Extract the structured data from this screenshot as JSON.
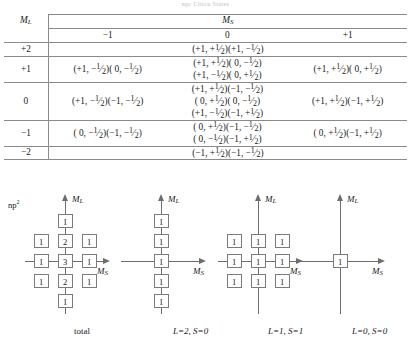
{
  "caption_top": "npc  Citicu  States",
  "table": {
    "corner_label": "M_L",
    "ms_header": "M_S",
    "ms_columns": [
      "-1",
      "0",
      "+1"
    ],
    "rows": [
      {
        "ml": "+2",
        "cells": [
          {
            "lines": []
          },
          {
            "lines": [
              "(+1, +1/2)(+1, -1/2)"
            ]
          },
          {
            "lines": []
          }
        ]
      },
      {
        "ml": "+1",
        "cells": [
          {
            "lines": [
              "(+1, -1/2)(  0, -1/2)"
            ]
          },
          {
            "lines": [
              "(+1, +1/2)(  0, -1/2)",
              "(+1, -1/2)(  0, +1/2)"
            ]
          },
          {
            "lines": [
              "(+1, +1/2)(  0, +1/2)"
            ]
          }
        ]
      },
      {
        "ml": "0",
        "cells": [
          {
            "lines": [
              "(+1, -1/2)(-1, -1/2)"
            ]
          },
          {
            "lines": [
              "(+1, +1/2)(-1, -1/2)",
              "(  0, +1/2)(  0, -1/2)",
              "(+1, -1/2)(-1, +1/2)"
            ]
          },
          {
            "lines": [
              "(+1, +1/2)(-1, +1/2)"
            ]
          }
        ]
      },
      {
        "ml": "-1",
        "cells": [
          {
            "lines": [
              "(  0, -1/2)(-1, -1/2)"
            ]
          },
          {
            "lines": [
              "(  0, +1/2)(-1, -1/2)",
              "(  0, -1/2)(-1, +1/2)"
            ]
          },
          {
            "lines": [
              "(  0, +1/2)(-1, +1/2)"
            ]
          }
        ]
      },
      {
        "ml": "-2",
        "cells": [
          {
            "lines": []
          },
          {
            "lines": [
              "(-1, +1/2)(-1, -1/2)"
            ]
          },
          {
            "lines": []
          }
        ]
      }
    ]
  },
  "diagrams": {
    "config_label": "np2",
    "axis_ml": "M_L",
    "axis_ms": "M_S",
    "items": [
      {
        "name": "total",
        "caption": "total",
        "grid": [
          [
            "",
            "1",
            ""
          ],
          [
            "1",
            "2",
            "1"
          ],
          [
            "1",
            "3",
            "1"
          ],
          [
            "1",
            "2",
            "1"
          ],
          [
            "",
            "1",
            ""
          ]
        ]
      },
      {
        "name": "L2S0",
        "caption": "L=2, S=0",
        "grid": [
          [
            "",
            "1",
            ""
          ],
          [
            "",
            "1",
            ""
          ],
          [
            "",
            "1",
            ""
          ],
          [
            "",
            "1",
            ""
          ],
          [
            "",
            "1",
            ""
          ]
        ]
      },
      {
        "name": "L1S1",
        "caption": "L=1, S=1",
        "grid": [
          [
            "",
            "",
            ""
          ],
          [
            "1",
            "1",
            "1"
          ],
          [
            "1",
            "1",
            "1"
          ],
          [
            "1",
            "1",
            "1"
          ],
          [
            "",
            "",
            ""
          ]
        ]
      },
      {
        "name": "L0S0",
        "caption": "L=0, S=0",
        "grid": [
          [
            "",
            "",
            ""
          ],
          [
            "",
            "",
            ""
          ],
          [
            "",
            "1",
            ""
          ],
          [
            "",
            "",
            ""
          ],
          [
            "",
            "",
            ""
          ]
        ]
      }
    ]
  }
}
